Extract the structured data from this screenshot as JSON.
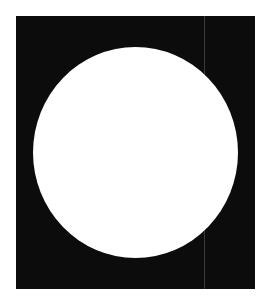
{
  "figure": {
    "colors": {
      "page_background": "#ffffff",
      "panel_background": "#0c0c0c",
      "circle_fill": "#ffffff",
      "artifact_line": "#3a3a3a"
    },
    "shapes": [
      {
        "type": "rectangle",
        "name": "black-panel"
      },
      {
        "type": "circle",
        "name": "white-circle"
      }
    ]
  }
}
